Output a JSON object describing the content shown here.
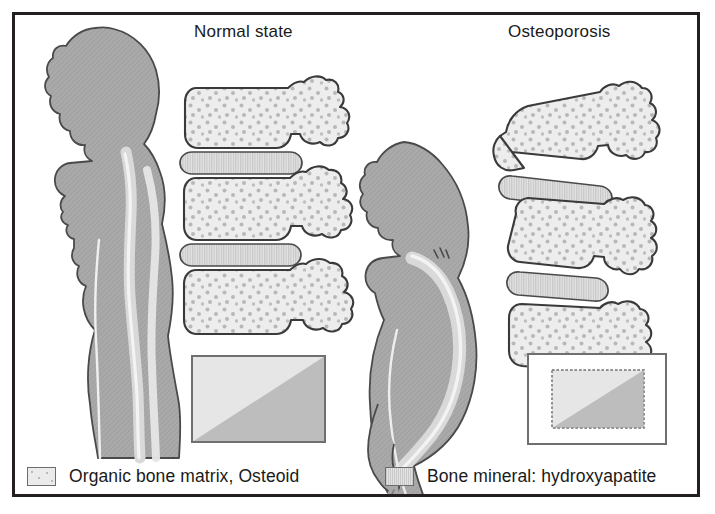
{
  "figure": {
    "kind": "medical-illustration",
    "panels": [
      {
        "id": "normal",
        "title": "Normal state",
        "body_posture": "upright standing silhouette, straight spine",
        "vertebrae_count": 3,
        "disc_count": 2,
        "bone_box_caption": "full bone mass block"
      },
      {
        "id": "osteoporosis",
        "title": "Osteoporosis",
        "body_posture": "stooped silhouette with thoracic kyphosis, leaning on a cane",
        "vertebrae_count": 3,
        "disc_count": 2,
        "bone_box_caption": "reduced bone mass block inside original outline"
      }
    ]
  },
  "titles": {
    "normal": "Normal state",
    "osteoporosis": "Osteoporosis"
  },
  "legend": {
    "items": [
      {
        "label": "Organic bone matrix, Osteoid",
        "swatch": "osteoid-swatch"
      },
      {
        "label": "Bone mineral: hydroxyapatite",
        "swatch": "mineral-swatch"
      }
    ]
  },
  "colors": {
    "frame_border": "#231f20",
    "background": "#ffffff",
    "body_fill": "#a8a8a8",
    "body_outline": "#4a4a4a",
    "spine_highlight": "#efefef",
    "spinal_canal": "#d8d8d8",
    "bone_fill": "#ececec",
    "bone_outline": "#3a3a3a",
    "bone_stipple": "#b4b4b4",
    "disc_fill": "#e0e0e0",
    "disc_hatch": "#c4c4c4",
    "mass_box_light": "#e4e4e4",
    "mass_box_dark": "#bcbcbc",
    "mass_box_border": "#6d6d6d",
    "text": "#1a1a1a"
  }
}
